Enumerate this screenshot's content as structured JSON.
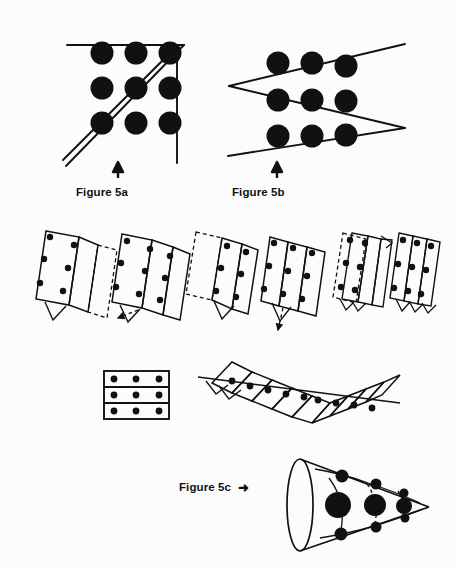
{
  "figure": {
    "background_color": "#fcfcfc",
    "ink_color": "#111111",
    "dot_color": "#111111"
  },
  "captions": {
    "fig_5a": "Figure 5a",
    "fig_5b": "Figure 5b",
    "fig_5c": "Figure 5c",
    "arrow_right_glyph": "➜",
    "arrow_up_glyph": "➤"
  },
  "panels": [
    {
      "id": "fig-5a",
      "label": "Figure 5a",
      "description": "Nine dot grid solved with four connected straight lines extending outside the square",
      "arrow_direction": "up",
      "grid": {
        "rows": 3,
        "cols": 3,
        "dot_count": 9,
        "dot_radius": 11,
        "x_positions": [
          102,
          136,
          170
        ],
        "y_positions": [
          53,
          88,
          123
        ]
      },
      "solution_lines": 4,
      "line_paths": [
        "68,46 182,46",
        "70,47 176,152",
        "177,50 177,158",
        "67,152 173,47"
      ]
    },
    {
      "id": "fig-5b",
      "label": "Figure 5b",
      "description": "Nine dot grid solved with three straight lines in a zigzag through fat dots",
      "arrow_direction": "up",
      "grid": {
        "rows": 3,
        "cols": 3,
        "dot_count": 9,
        "dot_radius": 11,
        "x_positions": [
          278,
          312,
          346
        ],
        "y_positions": [
          63,
          98,
          133
        ]
      },
      "solution_lines": 3,
      "line_paths": [
        "228,148 400,56",
        "228,148 400,152",
        "228,178 400,128"
      ]
    },
    {
      "id": "fold-sequence",
      "label": "Paper folding sequence",
      "description": "Six stages of folding the nine dot sheet so all dots align on one straight line",
      "stage_count": 6,
      "stages": [
        {
          "index": 1,
          "dots_visible": 6,
          "has_dashed_flap": true,
          "flap_side": "right"
        },
        {
          "index": 2,
          "dots_visible": 9,
          "has_dashed_flap": true,
          "flap_side": "bottom-left"
        },
        {
          "index": 3,
          "dots_visible": 6,
          "has_dashed_flap": true,
          "flap_side": "left"
        },
        {
          "index": 4,
          "dots_visible": 9,
          "has_dashed_flap": true,
          "flap_side": "bottom"
        },
        {
          "index": 5,
          "dots_visible": 6,
          "has_dashed_flap": true,
          "flap_side": "outline"
        },
        {
          "index": 6,
          "dots_visible": 9,
          "has_dashed_flap": false,
          "flap_side": "none"
        }
      ]
    },
    {
      "id": "flat-sheet",
      "label": "Flat sheet with nine dots",
      "description": "Rectangle with two horizontal fold lines and a 3 by 3 grid of dots",
      "rows": 3,
      "cols": 3,
      "dot_count": 9,
      "fold_lines": 2
    },
    {
      "id": "accordion",
      "label": "Accordion folded strip",
      "description": "Zigzag accordion fold bringing all nine dots into a single straight line pierced by one stroke",
      "panel_count": 9,
      "dot_count": 9
    },
    {
      "id": "fig-5c",
      "label": "Figure 5c",
      "description": "Cone rolled from the nine dot sheet, dots spiral around the cone surface so one line passes through all",
      "arrow_direction": "right",
      "dot_count": 9,
      "cone": {
        "base_center_x": 300,
        "base_center_y": 505,
        "base_rx": 13,
        "base_ry": 46,
        "apex_x": 428,
        "apex_y": 507
      }
    }
  ]
}
